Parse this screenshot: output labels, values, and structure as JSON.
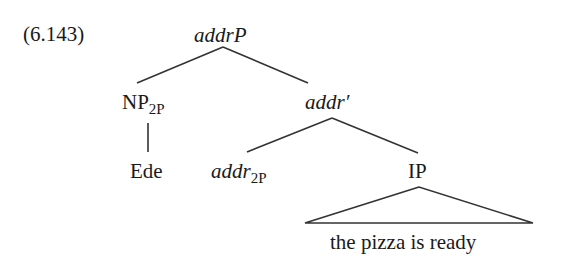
{
  "example_number": "(6.143)",
  "tree": {
    "root": {
      "label": "addrP",
      "italic": true
    },
    "spec": {
      "label": "NP",
      "subscript": "2P"
    },
    "spec_child": {
      "label": "Ede"
    },
    "bar": {
      "label": "addr′",
      "italic": true
    },
    "head": {
      "label": "addr",
      "subscript": "2P",
      "italic": true
    },
    "complement": {
      "label": "IP"
    },
    "complement_yield": {
      "label": "the pizza is ready",
      "triangle": true
    }
  },
  "line_color": "#333333"
}
